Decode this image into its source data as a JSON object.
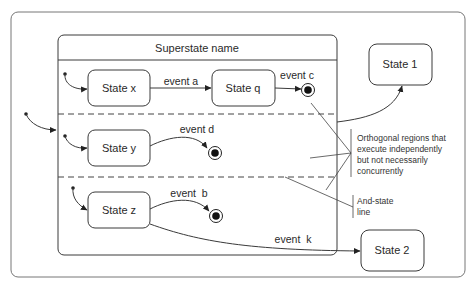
{
  "diagram": {
    "type": "UML state machine diagram (orthogonal regions)",
    "superstate": {
      "name": "Superstate name"
    },
    "regions": [
      {
        "states": [
          {
            "id": "x",
            "label": "State x"
          },
          {
            "id": "q",
            "label": "State q"
          }
        ],
        "transitions": [
          {
            "from": "initial",
            "to": "State x",
            "label": ""
          },
          {
            "from": "State x",
            "to": "State q",
            "label": "event a"
          },
          {
            "from": "State q",
            "to": "final",
            "label": "event c"
          }
        ]
      },
      {
        "states": [
          {
            "id": "y",
            "label": "State y"
          }
        ],
        "transitions": [
          {
            "from": "initial",
            "to": "State y",
            "label": ""
          },
          {
            "from": "State y",
            "to": "final",
            "label": "event d"
          }
        ]
      },
      {
        "states": [
          {
            "id": "z",
            "label": "State z"
          }
        ],
        "transitions": [
          {
            "from": "initial",
            "to": "State z",
            "label": ""
          },
          {
            "from": "State z",
            "to": "final",
            "label": "event  b"
          }
        ]
      }
    ],
    "external_states": [
      {
        "id": "s1",
        "label": "State 1"
      },
      {
        "id": "s2",
        "label": "State 2"
      }
    ],
    "external_transitions": [
      {
        "from": "initial",
        "to": "Superstate name",
        "label": ""
      },
      {
        "from": "Superstate name",
        "to": "State 1",
        "label": ""
      },
      {
        "from": "State z",
        "to": "State 2",
        "label": "event  k"
      }
    ],
    "annotations": {
      "orthogonal": [
        "Orthogonal regions that",
        "execute independently",
        "but not necessarily",
        "concurrently"
      ],
      "and_state": [
        "And-state",
        "line"
      ]
    }
  }
}
